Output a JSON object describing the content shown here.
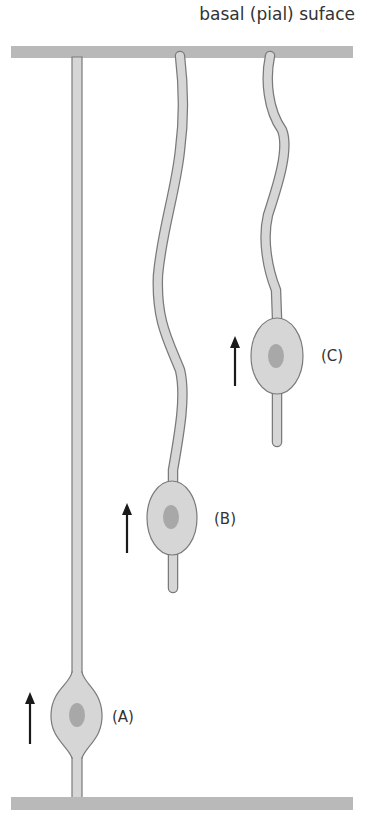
{
  "diagram": {
    "title": "basal (pial) suface",
    "colors": {
      "surface_bar": "#b9b9b9",
      "cell_fill": "#d6d6d6",
      "cell_stroke": "#7a7a7a",
      "nucleus": "#a8a8a8",
      "arrow": "#1a1a1a",
      "text": "#333333"
    },
    "surfaces": [
      {
        "name": "basal (pial) surface",
        "position": "top"
      },
      {
        "name": "apical surface",
        "position": "bottom"
      }
    ],
    "cells": [
      {
        "id": "A",
        "label": "(A)",
        "arrow": "up-arrow",
        "stage": "radial glial fiber spans both surfaces; cell body near apical surface"
      },
      {
        "id": "B",
        "label": "(B)",
        "arrow": "up-arrow",
        "stage": "detached from apical surface; cell body migrating upward"
      },
      {
        "id": "C",
        "label": "(C)",
        "arrow": "up-arrow",
        "stage": "cell body closer to basal (pial) surface"
      }
    ]
  }
}
